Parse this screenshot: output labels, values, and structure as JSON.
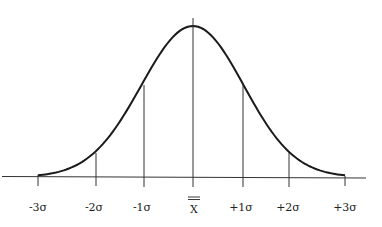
{
  "chart_data": {
    "type": "line",
    "title": "",
    "xlabel": "",
    "ylabel": "",
    "tick_labels": [
      "-3σ",
      "-2σ",
      "-1σ",
      "X̿",
      "+1σ",
      "+2σ",
      "+3σ"
    ],
    "x": [
      -3,
      -2,
      -1,
      0,
      1,
      2,
      3
    ],
    "y_relative_density": [
      0.011,
      0.135,
      0.607,
      1.0,
      0.607,
      0.135,
      0.011
    ],
    "grid": false,
    "legend": null,
    "colors": {
      "curve": "#1a1a1a",
      "lines": "#333333",
      "background": "#ffffff"
    }
  },
  "labels": {
    "m3": "-3σ",
    "m2": "-2σ",
    "m1": "-1σ",
    "mean": "X",
    "p1": "+1σ",
    "p2": "+2σ",
    "p3": "+3σ"
  }
}
